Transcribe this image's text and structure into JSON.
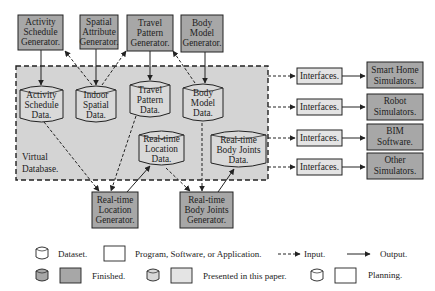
{
  "colors": {
    "background": "#ffffff",
    "database_fill": "#d4d4d4",
    "program_finished": "#a7a7a7",
    "dataset_presented": "#d9d9d9",
    "interface_fill": "#e4e4e4",
    "stroke": "#222222"
  },
  "top_generators": [
    {
      "lines": [
        "Activity",
        "Schedule",
        "Generator."
      ]
    },
    {
      "lines": [
        "Spatial",
        "Attribute",
        "Generator."
      ]
    },
    {
      "lines": [
        "Travel",
        "Pattern",
        "Generator."
      ]
    },
    {
      "lines": [
        "Body",
        "Model",
        "Generator."
      ]
    }
  ],
  "virtual_database": {
    "lines": [
      "Virtual",
      "Database."
    ]
  },
  "datasets": [
    {
      "lines": [
        "Activity",
        "Schedule",
        "Data."
      ]
    },
    {
      "lines": [
        "Indoor",
        "Spatial",
        "Data."
      ]
    },
    {
      "lines": [
        "Travel",
        "Pattern",
        "Data."
      ]
    },
    {
      "lines": [
        "Body",
        "Model",
        "Data."
      ]
    },
    {
      "lines": [
        "Real-time",
        "Location",
        "Data."
      ]
    },
    {
      "lines": [
        "Real-time",
        "Body Joints",
        "Data."
      ]
    }
  ],
  "bottom_generators": [
    {
      "lines": [
        "Real-time",
        "Location",
        "Generator."
      ]
    },
    {
      "lines": [
        "Real-time",
        "Body Joints",
        "Generator."
      ]
    }
  ],
  "interfaces": [
    {
      "label": "Interfaces.",
      "target": [
        "Smart Home",
        "Simulators."
      ]
    },
    {
      "label": "Interfaces.",
      "target": [
        "Robot",
        "Simulators."
      ]
    },
    {
      "label": "Interfaces.",
      "target": [
        "BIM",
        "Software."
      ]
    },
    {
      "label": "Interfaces.",
      "target": [
        "Other",
        "Simulators."
      ]
    }
  ],
  "legend": {
    "dataset": "Dataset.",
    "program": "Program, Software, or Application.",
    "input": "Input.",
    "output": "Output.",
    "finished": "Finished.",
    "presented": "Presented in this paper.",
    "planning": "Planning."
  }
}
